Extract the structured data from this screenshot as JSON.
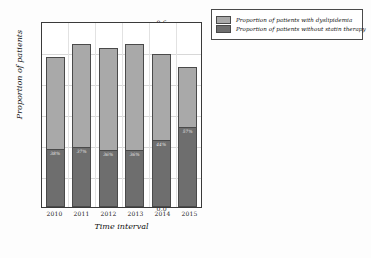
{
  "chart_data": {
    "type": "bar",
    "stacked": true,
    "title": "",
    "xlabel": "Time interval",
    "ylabel": "Proportion of patients",
    "categories": [
      "2010",
      "2011",
      "2012",
      "2013",
      "2014",
      "2015"
    ],
    "ylim": [
      0.0,
      0.6
    ],
    "yticks": [
      "0.0",
      "0.1",
      "0.2",
      "0.3",
      "0.4",
      "0.5",
      "0.6"
    ],
    "grid": true,
    "legend_position": "upper right outside",
    "series": [
      {
        "name": "Proportion of patients with dyslipidemia",
        "color": "#a9a9a9",
        "values": [
          0.49,
          0.53,
          0.52,
          0.53,
          0.5,
          0.455
        ]
      },
      {
        "name": "Proportion of patients without statin therapy",
        "color": "#6e6e6e",
        "values": [
          0.19,
          0.197,
          0.187,
          0.187,
          0.22,
          0.26
        ]
      }
    ],
    "bar_labels": [
      "38%",
      "37%",
      "36%",
      "36%",
      "44%",
      "57%"
    ]
  },
  "legend": {
    "entries": [
      {
        "label": "Proportion of patients with dyslipidemia"
      },
      {
        "label": "Proportion of patients without statin therapy"
      }
    ]
  }
}
